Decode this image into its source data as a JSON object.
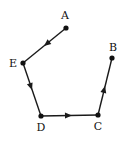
{
  "diagram": {
    "type": "directed-path",
    "stroke_color": "#1a1a1a",
    "nodes": [
      {
        "id": "A",
        "label": "A",
        "x": 66,
        "y": 28,
        "lx": 65,
        "ly": 19
      },
      {
        "id": "B",
        "label": "B",
        "x": 112,
        "y": 58,
        "lx": 113,
        "ly": 51
      },
      {
        "id": "C",
        "label": "C",
        "x": 98,
        "y": 115,
        "lx": 98,
        "ly": 130
      },
      {
        "id": "D",
        "label": "D",
        "x": 41,
        "y": 116,
        "lx": 41,
        "ly": 131
      },
      {
        "id": "E",
        "label": "E",
        "x": 23,
        "y": 63,
        "lx": 13,
        "ly": 67
      }
    ],
    "edges": [
      {
        "from": "A",
        "to": "E"
      },
      {
        "from": "E",
        "to": "D"
      },
      {
        "from": "D",
        "to": "C"
      },
      {
        "from": "C",
        "to": "B"
      }
    ]
  }
}
